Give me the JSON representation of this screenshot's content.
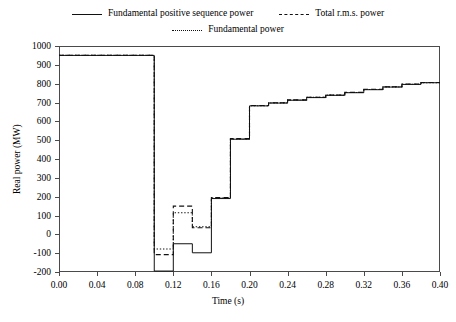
{
  "legend": {
    "rows": [
      [
        {
          "label": "Fundamental positive sequence power",
          "style": "solid",
          "icon": "solid-line-swatch"
        },
        {
          "label": "Total r.m.s. power",
          "style": "dashed",
          "icon": "dashed-line-swatch"
        }
      ],
      [
        {
          "label": "Fundamental power",
          "style": "dotted",
          "icon": "dotted-line-swatch"
        }
      ]
    ]
  },
  "chart_data": {
    "type": "line",
    "title": "",
    "xlabel": "Time (s)",
    "ylabel": "Real power (MW)",
    "xlim": [
      0.0,
      0.4
    ],
    "ylim": [
      -200,
      1000
    ],
    "xticks": [
      0.0,
      0.04,
      0.08,
      0.12,
      0.16,
      0.2,
      0.24,
      0.28,
      0.32,
      0.36,
      0.4
    ],
    "xtick_labels": [
      "0.00",
      "0.04",
      "0.08",
      "0.12",
      "0.16",
      "0.20",
      "0.24",
      "0.28",
      "0.32",
      "0.36",
      "0.40"
    ],
    "yticks": [
      -200,
      -100,
      0,
      100,
      200,
      300,
      400,
      500,
      600,
      700,
      800,
      900,
      1000
    ],
    "ytick_labels": [
      "-200",
      "-100",
      "0",
      "100",
      "200",
      "300",
      "400",
      "500",
      "600",
      "700",
      "800",
      "900",
      "1000"
    ],
    "grid": false,
    "legend_position": "above-plot",
    "drawstyle": "steps-post",
    "series": [
      {
        "name": "Fundamental positive sequence power",
        "style": "solid",
        "color": "#111111",
        "x": [
          0.0,
          0.1,
          0.12,
          0.14,
          0.16,
          0.18,
          0.2,
          0.22,
          0.24,
          0.26,
          0.28,
          0.3,
          0.32,
          0.34,
          0.36,
          0.38,
          0.4
        ],
        "y": [
          950,
          -195,
          -50,
          -98,
          190,
          505,
          682,
          697,
          712,
          726,
          738,
          752,
          768,
          782,
          796,
          805,
          805
        ]
      },
      {
        "name": "Total r.m.s. power",
        "style": "dashed",
        "color": "#111111",
        "x": [
          0.0,
          0.1,
          0.12,
          0.14,
          0.16,
          0.18,
          0.2,
          0.22,
          0.24,
          0.26,
          0.28,
          0.3,
          0.32,
          0.34,
          0.36,
          0.38,
          0.4
        ],
        "y": [
          950,
          -108,
          150,
          35,
          195,
          508,
          684,
          699,
          714,
          728,
          740,
          754,
          770,
          784,
          798,
          806,
          806
        ]
      },
      {
        "name": "Fundamental power",
        "style": "dotted",
        "color": "#111111",
        "x": [
          0.0,
          0.1,
          0.12,
          0.14,
          0.16,
          0.18,
          0.2,
          0.22,
          0.24,
          0.26,
          0.28,
          0.3,
          0.32,
          0.34,
          0.36,
          0.38,
          0.4
        ],
        "y": [
          950,
          -78,
          115,
          40,
          192,
          506,
          683,
          698,
          713,
          727,
          739,
          753,
          769,
          783,
          797,
          805,
          805
        ]
      }
    ]
  }
}
